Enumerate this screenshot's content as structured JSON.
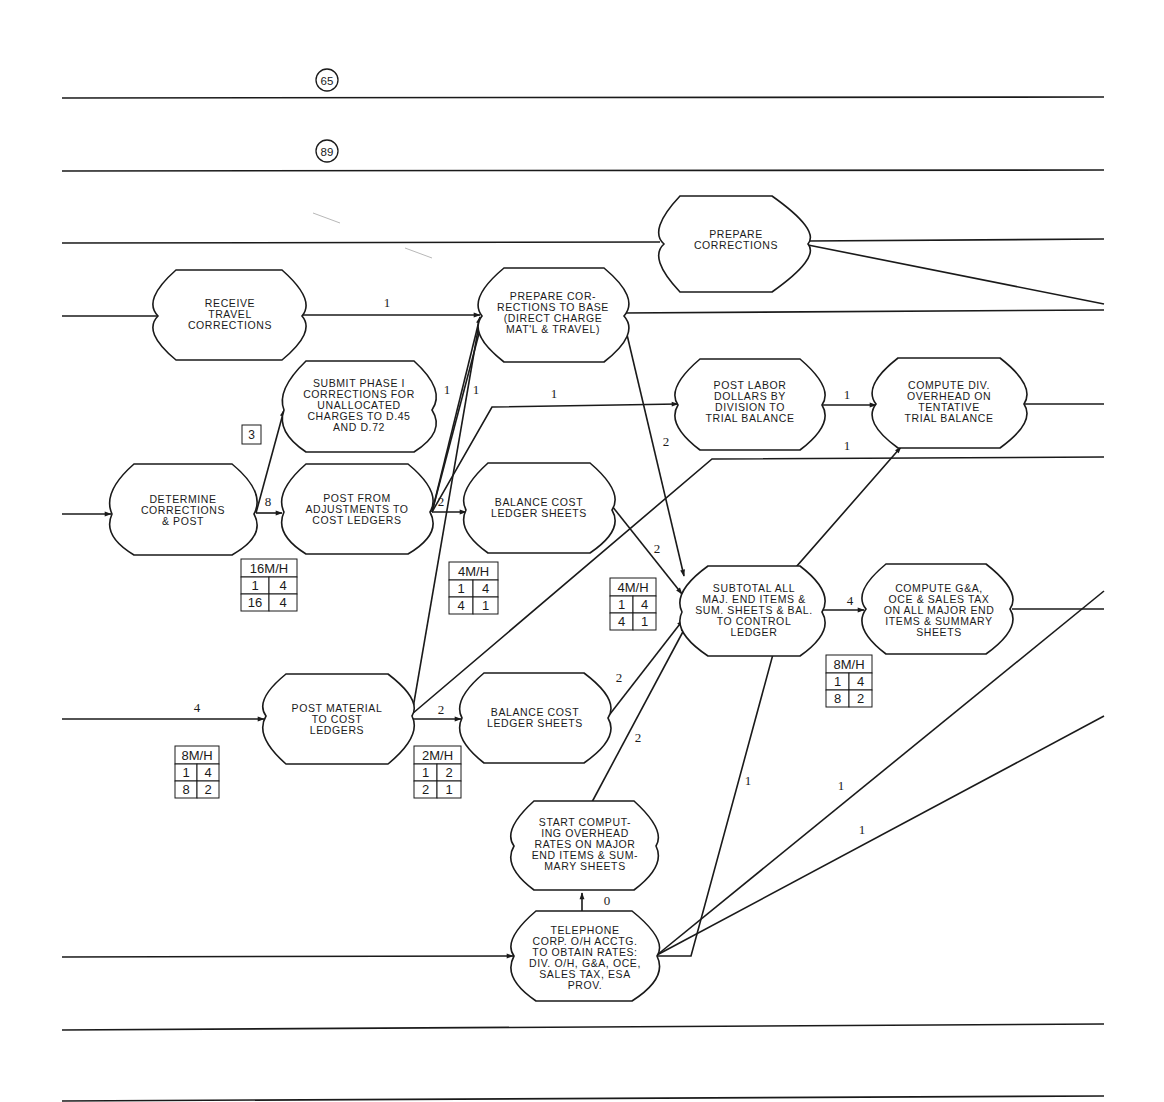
{
  "page_refs": {
    "ref_top": "65",
    "ref_second": "89"
  },
  "step_box_label": "3",
  "nodes": {
    "prepare_corrections": [
      "PREPARE",
      "CORRECTIONS"
    ],
    "receive_travel": [
      "RECEIVE",
      "TRAVEL",
      "CORRECTIONS"
    ],
    "prepare_base": [
      "PREPARE COR-",
      "RECTIONS TO BASE",
      "(DIRECT CHARGE",
      "MAT'L & TRAVEL)"
    ],
    "submit_phase": [
      "SUBMIT PHASE I",
      "CORRECTIONS FOR",
      "UNALLOCATED",
      "CHARGES TO D.45",
      "AND D.72"
    ],
    "post_labor": [
      "POST LABOR",
      "DOLLARS BY",
      "DIVISION TO",
      "TRIAL BALANCE"
    ],
    "compute_div": [
      "COMPUTE DIV.",
      "OVERHEAD ON",
      "TENTATIVE",
      "TRIAL BALANCE"
    ],
    "determine": [
      "DETERMINE",
      "CORRECTIONS",
      "& POST"
    ],
    "post_adjust": [
      "POST FROM",
      "ADJUSTMENTS TO",
      "COST LEDGERS"
    ],
    "balance_1": [
      "BALANCE COST",
      "LEDGER SHEETS"
    ],
    "subtotal": [
      "SUBTOTAL ALL",
      "MAJ. END ITEMS &",
      "SUM. SHEETS & BAL.",
      "TO CONTROL",
      "LEDGER"
    ],
    "compute_ga": [
      "COMPUTE G&A,",
      "OCE & SALES TAX",
      "ON ALL MAJOR END",
      "ITEMS & SUMMARY",
      "SHEETS"
    ],
    "post_material": [
      "POST MATERIAL",
      "TO COST",
      "LEDGERS"
    ],
    "balance_2": [
      "BALANCE COST",
      "LEDGER SHEETS"
    ],
    "start_computing": [
      "START COMPUT-",
      "ING OVERHEAD",
      "RATES ON MAJOR",
      "END ITEMS & SUM-",
      "MARY SHEETS"
    ],
    "telephone": [
      "TELEPHONE",
      "CORP. O/H ACCTG.",
      "TO OBTAIN RATES:",
      "DIV. O/H, G&A, OCE,",
      "SALES TAX, ESA",
      "PROV."
    ]
  },
  "edge_labels": {
    "receive_to_base": "1",
    "determine_to_adjust": "8",
    "adjust_to_base_a": "1",
    "adjust_to_base_b": "1",
    "adjust_to_labor": "1",
    "adjust_to_balance": "2",
    "base_to_subtotal": "2",
    "labor_to_compute": "1",
    "material_to_compute_div": "1",
    "balance1_to_subtotal": "2",
    "subtotal_to_ga": "4",
    "input_to_material": "4",
    "material_to_balance2": "2",
    "balance2_to_subtotal": "2",
    "start_to_subtotal": "2",
    "telephone_to_start": "0",
    "telephone_out_a": "1",
    "telephone_out_b": "1",
    "telephone_out_c": "1"
  },
  "manhour_tables": [
    {
      "id": "mh_adjust",
      "header": "16M/H",
      "cells": [
        [
          "1",
          "4"
        ],
        [
          "16",
          "4"
        ]
      ]
    },
    {
      "id": "mh_balance1",
      "header": "4M/H",
      "cells": [
        [
          "1",
          "4"
        ],
        [
          "4",
          "1"
        ]
      ]
    },
    {
      "id": "mh_subtotal",
      "header": "4M/H",
      "cells": [
        [
          "1",
          "4"
        ],
        [
          "4",
          "1"
        ]
      ]
    },
    {
      "id": "mh_ga",
      "header": "8M/H",
      "cells": [
        [
          "1",
          "4"
        ],
        [
          "8",
          "2"
        ]
      ]
    },
    {
      "id": "mh_material",
      "header": "8M/H",
      "cells": [
        [
          "1",
          "4"
        ],
        [
          "8",
          "2"
        ]
      ]
    },
    {
      "id": "mh_balance2",
      "header": "2M/H",
      "cells": [
        [
          "1",
          "2"
        ],
        [
          "2",
          "1"
        ]
      ]
    }
  ]
}
